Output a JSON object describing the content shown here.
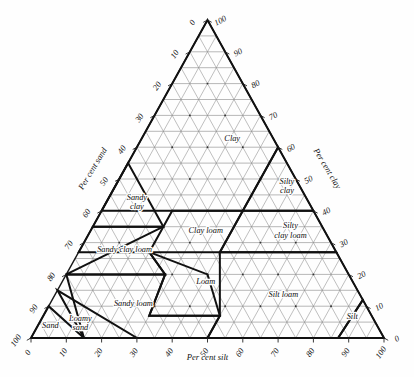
{
  "chart_data": {
    "type": "other",
    "subtype": "ternary-soil-texture-triangle",
    "title": "",
    "axes": {
      "left": {
        "label": "Per cent sand",
        "ticks": [
          0,
          10,
          20,
          30,
          40,
          50,
          60,
          70,
          80,
          90,
          100
        ],
        "range": [
          0,
          100
        ]
      },
      "right": {
        "label": "Per cent clay",
        "ticks": [
          0,
          10,
          20,
          30,
          40,
          50,
          60,
          70,
          80,
          90,
          100
        ],
        "range": [
          0,
          100
        ]
      },
      "bottom": {
        "label": "Per cent silt",
        "ticks": [
          0,
          10,
          20,
          30,
          40,
          50,
          60,
          70,
          80,
          90,
          100
        ],
        "range": [
          0,
          100
        ]
      }
    },
    "grid": {
      "on": true,
      "interval": 5,
      "tick_interval": 10
    },
    "vertices": {
      "apex": {
        "clay": 100,
        "silt": 0,
        "sand": 0
      },
      "bottom_left": {
        "clay": 0,
        "silt": 0,
        "sand": 100
      },
      "bottom_right": {
        "clay": 0,
        "silt": 100,
        "sand": 0
      }
    },
    "classes": [
      {
        "name": "Clay",
        "label_lines": [
          "Clay"
        ],
        "label_at": {
          "clay": 62,
          "silt": 26,
          "sand": 12
        },
        "polygon": [
          [
            40,
            0,
            60
          ],
          [
            40,
            40,
            20
          ],
          [
            60,
            40,
            0
          ],
          [
            100,
            0,
            0
          ]
        ]
      },
      {
        "name": "Silty clay",
        "label_lines": [
          "Silty",
          "clay"
        ],
        "label_at": {
          "clay": 47,
          "silt": 49,
          "sand": 4
        },
        "polygon": [
          [
            40,
            40,
            20
          ],
          [
            40,
            60,
            0
          ],
          [
            60,
            40,
            0
          ]
        ]
      },
      {
        "name": "Silty clay loam",
        "label_lines": [
          "Silty",
          "clay loam"
        ],
        "label_at": {
          "clay": 33,
          "silt": 57,
          "sand": 10
        },
        "polygon": [
          [
            27,
            40,
            33
          ],
          [
            27,
            73,
            0
          ],
          [
            40,
            60,
            0
          ],
          [
            40,
            40,
            20
          ]
        ]
      },
      {
        "name": "Sandy clay",
        "label_lines": [
          "Sandy",
          "clay"
        ],
        "label_at": {
          "clay": 42,
          "silt": 9,
          "sand": 49
        },
        "polygon": [
          [
            35,
            0,
            65
          ],
          [
            35,
            20,
            45
          ],
          [
            55,
            0,
            45
          ]
        ]
      },
      {
        "name": "Clay loam",
        "label_lines": [
          "Clay loam"
        ],
        "label_at": {
          "clay": 33,
          "silt": 33,
          "sand": 34
        },
        "polygon": [
          [
            27,
            20,
            53
          ],
          [
            27,
            40,
            33
          ],
          [
            40,
            40,
            20
          ],
          [
            40,
            20,
            40
          ]
        ]
      },
      {
        "name": "Sandy clay loam",
        "label_lines": [
          "Sandy clay loam"
        ],
        "label_at": {
          "clay": 27,
          "silt": 13,
          "sand": 60
        },
        "polygon": [
          [
            20,
            0,
            80
          ],
          [
            20,
            28,
            52
          ],
          [
            27,
            20,
            53
          ],
          [
            27,
            0,
            73
          ],
          [
            35,
            0,
            65
          ],
          [
            35,
            20,
            45
          ]
        ]
      },
      {
        "name": "Loam",
        "label_lines": [
          "Loam"
        ],
        "label_at": {
          "clay": 17,
          "silt": 41,
          "sand": 42
        },
        "polygon": [
          [
            7,
            30,
            63
          ],
          [
            7,
            50,
            43
          ],
          [
            20,
            40,
            40
          ],
          [
            27,
            20,
            53
          ],
          [
            20,
            28,
            52
          ]
        ]
      },
      {
        "name": "Silt loam",
        "label_lines": [
          "Silt loam"
        ],
        "label_at": {
          "clay": 13,
          "silt": 65,
          "sand": 22
        },
        "polygon": [
          [
            0,
            50,
            50
          ],
          [
            0,
            87,
            13
          ],
          [
            12,
            88,
            0
          ],
          [
            27,
            73,
            0
          ],
          [
            27,
            40,
            33
          ],
          [
            7,
            50,
            43
          ]
        ]
      },
      {
        "name": "Silt",
        "label_lines": [
          "Silt"
        ],
        "label_at": {
          "clay": 6,
          "silt": 88,
          "sand": 6
        },
        "polygon": [
          [
            0,
            87,
            13
          ],
          [
            0,
            100,
            0
          ],
          [
            12,
            88,
            0
          ]
        ]
      },
      {
        "name": "Sandy loam",
        "label_lines": [
          "Sandy loam"
        ],
        "label_at": {
          "clay": 10,
          "silt": 24,
          "sand": 66
        },
        "polygon": [
          [
            0,
            50,
            50
          ],
          [
            7,
            50,
            43
          ],
          [
            7,
            30,
            63
          ],
          [
            20,
            28,
            52
          ],
          [
            20,
            0,
            80
          ],
          [
            0,
            15,
            85
          ]
        ]
      },
      {
        "name": "Loamy sand",
        "label_lines": [
          "Loamy",
          "sand"
        ],
        "label_at": {
          "clay": 4,
          "silt": 12,
          "sand": 84
        },
        "polygon": [
          [
            0,
            15,
            85
          ],
          [
            0,
            30,
            70
          ],
          [
            15,
            0,
            85
          ]
        ]
      },
      {
        "name": "Sand",
        "label_lines": [
          "Sand"
        ],
        "label_at": {
          "clay": 3,
          "silt": 4,
          "sand": 93
        },
        "polygon": [
          [
            0,
            0,
            100
          ],
          [
            0,
            15,
            85
          ],
          [
            10,
            0,
            90
          ]
        ]
      }
    ]
  },
  "labels": {
    "axis_left": "Per cent sand",
    "axis_right": "Per cent clay",
    "axis_bottom": "Per cent silt"
  }
}
